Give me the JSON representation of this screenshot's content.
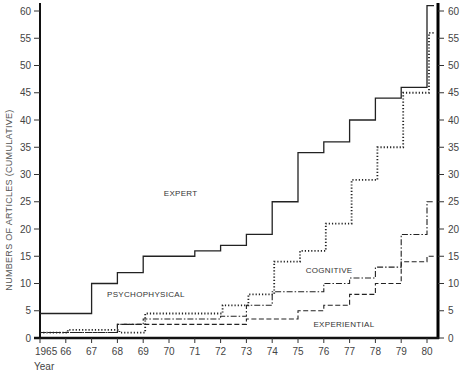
{
  "chart_data": {
    "type": "line",
    "step": true,
    "title": "",
    "xlabel": "Year",
    "ylabel": "NUMBERS OF ARTICLES (CUMULATIVE)",
    "x": [
      1965,
      1966,
      1967,
      1968,
      1969,
      1970,
      1971,
      1972,
      1973,
      1974,
      1975,
      1976,
      1977,
      1978,
      1979,
      1980
    ],
    "x_tick_labels": [
      "1965",
      "66",
      "67",
      "68",
      "69",
      "70",
      "71",
      "72",
      "73",
      "74",
      "75",
      "76",
      "77",
      "78",
      "79",
      "80"
    ],
    "y_ticks": [
      0,
      5,
      10,
      15,
      20,
      25,
      30,
      35,
      40,
      45,
      50,
      55,
      60
    ],
    "ylim": [
      0,
      62
    ],
    "grid": false,
    "right_axis_mirrors_left": true,
    "series": [
      {
        "name": "EXPERT",
        "line_style": "solid",
        "values": [
          4.5,
          4.5,
          10,
          12,
          15,
          15,
          16,
          17,
          19,
          25,
          34,
          36,
          40,
          44,
          46,
          61
        ],
        "label_pos": {
          "year": 1969.8,
          "value": 26
        }
      },
      {
        "name": "COGNITIVE",
        "line_style": "dotted",
        "values": [
          1,
          1.5,
          1.5,
          1,
          4.5,
          4.5,
          4.5,
          6,
          8,
          14,
          16,
          21,
          29,
          35,
          45,
          56
        ],
        "label_pos": {
          "year": 1975.3,
          "value": 12
        }
      },
      {
        "name": "PSYCHOPHYSICAL",
        "line_style": "dash-dot",
        "values": [
          1,
          1,
          1,
          2.5,
          3.5,
          3.5,
          3.5,
          4,
          6,
          8.5,
          8.5,
          10,
          11,
          13,
          19,
          25
        ],
        "label_pos": {
          "year": 1967.6,
          "value": 7.5
        }
      },
      {
        "name": "EXPERIENTIAL",
        "line_style": "dashed",
        "values": [
          1,
          1,
          1,
          2.5,
          2.5,
          2.5,
          2.5,
          2.5,
          3.5,
          3.5,
          5,
          6,
          8,
          10,
          14,
          15
        ],
        "label_pos": {
          "year": 1975.6,
          "value": 2
        }
      }
    ]
  }
}
